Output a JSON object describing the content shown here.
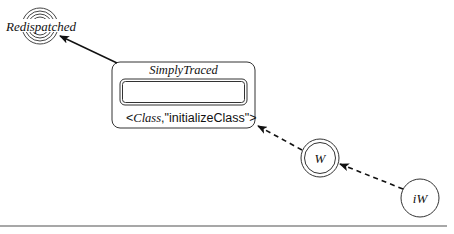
{
  "diagram": {
    "background": "#ffffff",
    "stroke_color": "#333333",
    "baseline_color": "#8a8a8a",
    "nodes": {
      "redispatched": {
        "label": "Redispatched",
        "cx": 40,
        "cy": 26,
        "rings": [
          9,
          12,
          15,
          18
        ]
      },
      "simply_traced": {
        "title": "SimplyTraced",
        "x": 112,
        "y": 62,
        "width": 143,
        "height": 66,
        "radius": 8,
        "inner": {
          "x": 120,
          "y": 79,
          "width": 127,
          "height": 26,
          "radius": 5
        },
        "label_open": "<",
        "label_class": "Class",
        "label_rest": ",\"initializeClass\">"
      },
      "w": {
        "label": "W",
        "cx": 320,
        "cy": 158,
        "outer_r": 19,
        "inner_r": 15.5
      },
      "iw": {
        "label": "iW",
        "cx": 420,
        "cy": 198,
        "r": 19
      }
    },
    "edges": [
      {
        "from": "simply_traced",
        "to": "redispatched",
        "style": "solid",
        "x1": 117,
        "y1": 63,
        "x2": 60,
        "y2": 36
      },
      {
        "from": "w",
        "to": "simply_traced",
        "style": "dashed",
        "x1": 302,
        "y1": 150,
        "x2": 258,
        "y2": 126
      },
      {
        "from": "iw",
        "to": "w",
        "style": "dashed",
        "x1": 403,
        "y1": 189,
        "x2": 340,
        "y2": 164
      }
    ],
    "baseline": {
      "x1": 0,
      "y1": 226,
      "x2": 447,
      "y2": 226
    }
  }
}
